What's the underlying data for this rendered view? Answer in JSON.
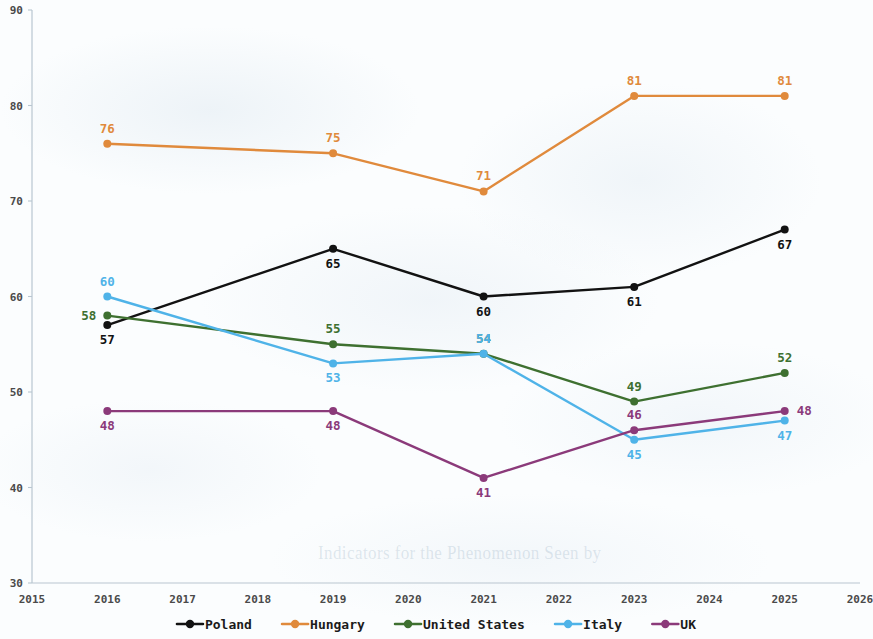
{
  "chart_data": {
    "type": "line",
    "title": "",
    "xlabel": "",
    "ylabel": "",
    "x": [
      2016,
      2019,
      2021,
      2023,
      2025
    ],
    "xlim": [
      2015,
      2026
    ],
    "ylim": [
      30,
      90
    ],
    "xticks": [
      "2015",
      "2016",
      "2017",
      "2018",
      "2019",
      "2020",
      "2021",
      "2022",
      "2023",
      "2024",
      "2025",
      "2026"
    ],
    "yticks": [
      "30",
      "40",
      "50",
      "60",
      "70",
      "80",
      "90"
    ],
    "grid": false,
    "legend_position": "bottom",
    "markers": "circle",
    "data_labels": true,
    "series": [
      {
        "name": "Poland",
        "color": "#121212",
        "values": [
          57,
          65,
          60,
          61,
          67
        ],
        "labels": [
          "57",
          "65",
          "60",
          "61",
          "67"
        ],
        "label_positions": [
          "below",
          "below",
          "below",
          "below",
          "below"
        ]
      },
      {
        "name": "Hungary",
        "color": "#e08a3c",
        "values": [
          76,
          75,
          71,
          81,
          81
        ],
        "labels": [
          "76",
          "75",
          "71",
          "81",
          "81"
        ],
        "label_positions": [
          "above",
          "above",
          "above",
          "above",
          "above"
        ]
      },
      {
        "name": "United States",
        "color": "#3e7030",
        "values": [
          58,
          55,
          54,
          49,
          52
        ],
        "labels": [
          "58",
          "55",
          "54",
          "49",
          "52"
        ],
        "label_positions": [
          "left",
          "above",
          "above",
          "above",
          "above"
        ]
      },
      {
        "name": "Italy",
        "color": "#4fb3e8",
        "values": [
          60,
          53,
          54,
          45,
          47
        ],
        "labels": [
          "60",
          "53",
          "54",
          "45",
          "47"
        ],
        "label_positions": [
          "above",
          "below",
          "above",
          "below",
          "below"
        ]
      },
      {
        "name": "UK",
        "color": "#8b3a7a",
        "values": [
          48,
          48,
          41,
          46,
          48
        ],
        "labels": [
          "48",
          "48",
          "41",
          "46",
          "48"
        ],
        "label_positions": [
          "below",
          "below",
          "below",
          "above",
          "right"
        ]
      }
    ]
  },
  "legend": {
    "items": [
      {
        "label": "Poland",
        "color": "#121212"
      },
      {
        "label": "Hungary",
        "color": "#e08a3c"
      },
      {
        "label": "United States",
        "color": "#3e7030"
      },
      {
        "label": "Italy",
        "color": "#4fb3e8"
      },
      {
        "label": "UK",
        "color": "#8b3a7a"
      }
    ]
  },
  "artifacts": {
    "bleed_through_text": "Indicators for the Phenomenon Seen by"
  }
}
